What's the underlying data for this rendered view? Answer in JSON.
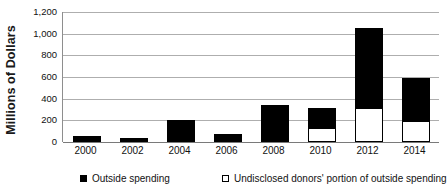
{
  "chart_data": {
    "type": "bar",
    "subtype": "stacked-bar",
    "title": "",
    "xlabel": "",
    "ylabel": "Millions of Dollars",
    "ylim": [
      0,
      1200
    ],
    "ytick_step": 200,
    "yticks": [
      "0",
      "200",
      "400",
      "600",
      "800",
      "1,000",
      "1,200"
    ],
    "ytick_values": [
      0,
      200,
      400,
      600,
      800,
      1000,
      1200
    ],
    "categories": [
      "2000",
      "2002",
      "2004",
      "2006",
      "2008",
      "2010",
      "2012",
      "2014"
    ],
    "grid": true,
    "grid_axis": "y",
    "legend_position": "bottom",
    "series": [
      {
        "name": "Outside spending",
        "swatch": "filled-square",
        "color": "#000000",
        "values": [
          55,
          35,
          200,
          75,
          345,
          310,
          1050,
          590
        ]
      },
      {
        "name": "Undisclosed donors' portion of outside spending",
        "swatch": "open-square",
        "color": "#ffffff",
        "values": [
          0,
          0,
          0,
          0,
          20,
          130,
          310,
          195
        ]
      }
    ]
  },
  "axis": {
    "y_title": "Millions of Dollars"
  },
  "legend": {
    "items": [
      {
        "label": "Outside spending",
        "swatch": "filled-square-icon"
      },
      {
        "label": "Undisclosed donors' portion of outside spending",
        "swatch": "open-square-icon"
      }
    ]
  },
  "colors": {
    "bar_total": "#000000",
    "bar_undisclosed": "#ffffff",
    "gridline": "#aeaeae",
    "axis": "#7a7a7a",
    "text": "#111111",
    "background": "#ffffff"
  }
}
